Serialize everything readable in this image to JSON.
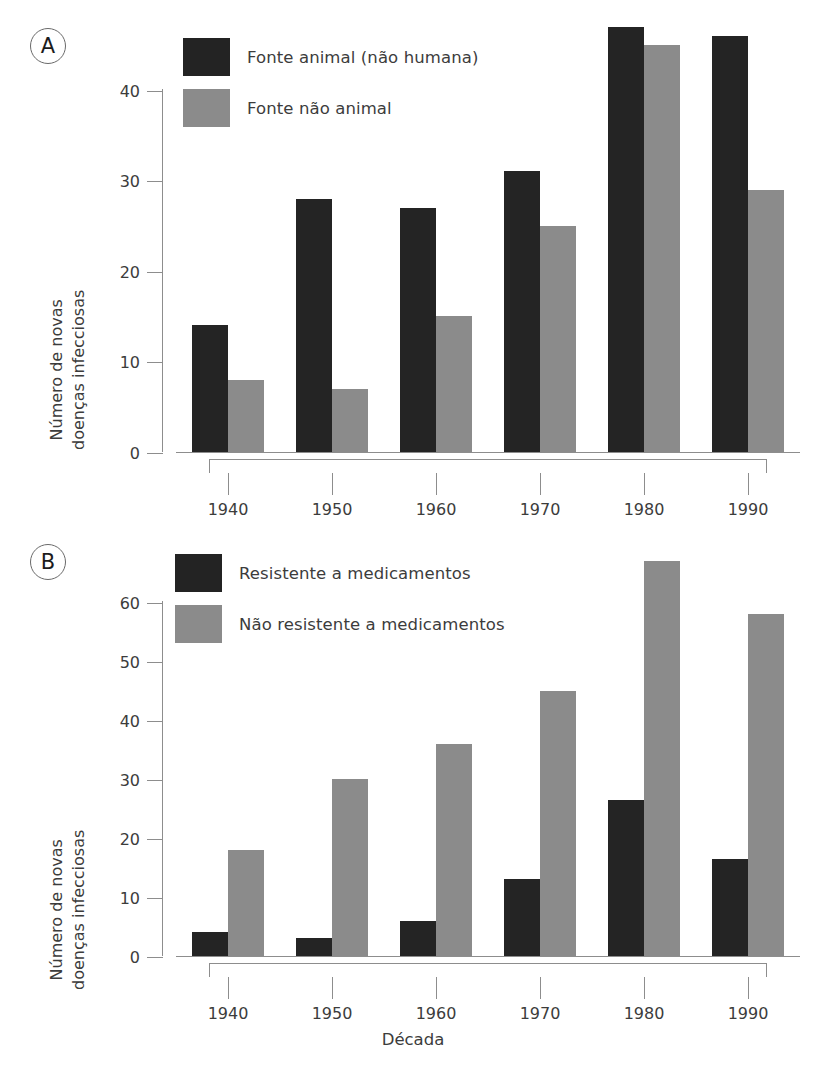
{
  "figure": {
    "panel_a_label": "A",
    "panel_b_label": "B",
    "xlabel": "Década",
    "ylabel_line1": "Número de novas",
    "ylabel_line2": "doenças infecciosas",
    "colors": {
      "dark": "#242424",
      "gray": "#8b8b8b",
      "axis": "#8d8d8d",
      "text": "#3c3c3c"
    }
  },
  "chart_data": [
    {
      "type": "bar",
      "panel": "A",
      "title": "",
      "xlabel": "Década",
      "ylabel": "Número de novas doenças infecciosas",
      "categories": [
        "1940",
        "1950",
        "1960",
        "1970",
        "1980",
        "1990"
      ],
      "yticks": [
        0,
        10,
        20,
        30,
        40
      ],
      "ylim": [
        0,
        50
      ],
      "grid": false,
      "legend_position": "top-center",
      "series": [
        {
          "name": "Fonte animal (não humana)",
          "color": "#242424",
          "values": [
            14,
            28,
            27,
            31,
            47,
            46
          ]
        },
        {
          "name": "Fonte não animal",
          "color": "#8b8b8b",
          "values": [
            8,
            7,
            15,
            25,
            45,
            29
          ]
        }
      ]
    },
    {
      "type": "bar",
      "panel": "B",
      "title": "",
      "xlabel": "Década",
      "ylabel": "Número de novas doenças infecciosas",
      "categories": [
        "1940",
        "1950",
        "1960",
        "1970",
        "1980",
        "1990"
      ],
      "yticks": [
        0,
        10,
        20,
        30,
        40,
        50,
        60
      ],
      "ylim": [
        0,
        70
      ],
      "grid": false,
      "legend_position": "top-center",
      "series": [
        {
          "name": "Resistente a medicamentos",
          "color": "#242424",
          "values": [
            4,
            3,
            6,
            13,
            26.5,
            16.5
          ]
        },
        {
          "name": "Não resistente a medicamentos",
          "color": "#8b8b8b",
          "values": [
            18,
            30,
            36,
            45,
            67,
            58
          ]
        }
      ]
    }
  ],
  "caption": {
    "partial_text": ""
  }
}
